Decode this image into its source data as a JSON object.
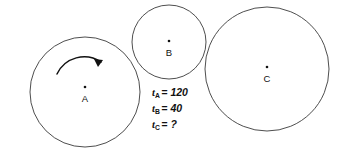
{
  "figure": {
    "background_color": "#ffffff",
    "stroke_color": "#3a3a3a",
    "text_color": "#111111",
    "width": 339,
    "height": 150
  },
  "circles": [
    {
      "id": "A",
      "label": "A",
      "cx": 85,
      "cy": 92,
      "r": 55,
      "dot_cx": 85,
      "dot_cy": 87,
      "label_x": 85,
      "label_y": 99
    },
    {
      "id": "B",
      "label": "B",
      "cx": 169,
      "cy": 42,
      "r": 37,
      "dot_cx": 169,
      "dot_cy": 41,
      "label_x": 169,
      "label_y": 53
    },
    {
      "id": "C",
      "label": "C",
      "cx": 267,
      "cy": 69,
      "r": 62,
      "dot_cx": 267,
      "dot_cy": 67,
      "label_x": 267,
      "label_y": 79
    }
  ],
  "rotation_arrow": {
    "name": "clockwise-rotation-arrow",
    "direction": "clockwise",
    "on_circle": "A",
    "arc_path": "M 57,74 A 30,30 0 0 1 101,62",
    "head_path": "M 103,60 L 94,59 L 98,67 Z"
  },
  "equations": [
    {
      "var": "t",
      "subscript": "A",
      "rest": "= 120",
      "x": 152,
      "y": 96
    },
    {
      "var": "t",
      "subscript": "B",
      "rest": "= 40",
      "x": 152,
      "y": 112
    },
    {
      "var": "t",
      "subscript": "C",
      "rest": "= ?",
      "x": 152,
      "y": 128
    }
  ]
}
